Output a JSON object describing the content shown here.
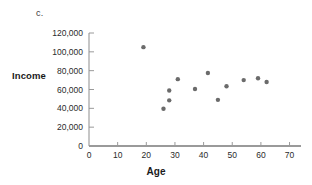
{
  "figure": {
    "part_label": "c.",
    "y_axis_title": "Income",
    "x_axis_title": "Age"
  },
  "chart_data": {
    "type": "scatter",
    "title": "",
    "subtitle": "",
    "part_label": "c.",
    "xlabel": "Age",
    "ylabel": "Income",
    "xlim": [
      0,
      74
    ],
    "ylim": [
      0,
      120000
    ],
    "xticks": [
      0,
      10,
      20,
      30,
      40,
      50,
      60,
      70
    ],
    "xtick_labels": [
      "0",
      "10",
      "20",
      "30",
      "40",
      "50",
      "60",
      "70"
    ],
    "yticks": [
      0,
      20000,
      40000,
      60000,
      80000,
      100000,
      120000
    ],
    "ytick_labels": [
      "0",
      "20,000",
      "40,000",
      "60,000",
      "80,000",
      "100,000",
      "120,000"
    ],
    "grid": false,
    "legend": null,
    "marker_color": "#6b6b6b",
    "marker_size": 2.2,
    "axis_color": "#9a9a9a",
    "series": [
      {
        "name": "Income by Age",
        "points": [
          {
            "x": 19,
            "y": 105000
          },
          {
            "x": 26,
            "y": 39500
          },
          {
            "x": 28,
            "y": 59000
          },
          {
            "x": 28,
            "y": 48500
          },
          {
            "x": 31,
            "y": 71000
          },
          {
            "x": 37,
            "y": 60500
          },
          {
            "x": 41.5,
            "y": 77500
          },
          {
            "x": 45,
            "y": 49000
          },
          {
            "x": 48,
            "y": 63500
          },
          {
            "x": 54,
            "y": 70000
          },
          {
            "x": 59,
            "y": 72000
          },
          {
            "x": 62,
            "y": 68000
          }
        ]
      }
    ]
  }
}
